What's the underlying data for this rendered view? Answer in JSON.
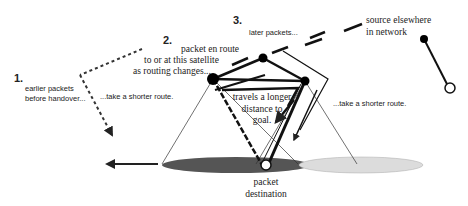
{
  "steps": [
    {
      "number": "1.",
      "label_lines": [
        "earlier packets",
        "before handover..."
      ],
      "route_note": "...take a shorter route."
    },
    {
      "number": "2.",
      "label_lines": [
        "packet en route",
        "to or at this satellite",
        "as routing changes..."
      ],
      "route_note": "travels a longer distance to goal."
    },
    {
      "number": "3.",
      "label_lines": [
        "later packets..."
      ],
      "route_note": "...take a shorter route."
    }
  ],
  "labels": {
    "step1_number": "1.",
    "step1_line1": "earlier packets",
    "step1_line2": "before handover...",
    "step1_route": "...take a shorter route.",
    "step2_number": "2.",
    "step2_line1": "packet en route",
    "step2_line2": "to or at this satellite",
    "step2_line3": "as routing changes...",
    "step2_route_line1": "travels a longer",
    "step2_route_line2": "distance to",
    "step2_route_line3": "goal.",
    "step3_number": "3.",
    "step3_line1": "later packets...",
    "step3_route": "...take a shorter route.",
    "source_line1": "source elsewhere",
    "source_line2": "in network",
    "destination_line1": "packet",
    "destination_line2": "destination"
  },
  "nodes": [
    {
      "id": "satellite-left",
      "type": "satellite",
      "fill": "#000000"
    },
    {
      "id": "satellite-top",
      "type": "satellite",
      "fill": "#000000"
    },
    {
      "id": "satellite-right",
      "type": "satellite",
      "fill": "#000000"
    },
    {
      "id": "source",
      "type": "satellite",
      "fill": "#000000"
    },
    {
      "id": "source-ground",
      "type": "ground",
      "fill": "#ffffff"
    },
    {
      "id": "destination",
      "type": "ground",
      "fill": "#ffffff"
    }
  ],
  "footprints": [
    {
      "id": "footprint-left",
      "fill": "#555555"
    },
    {
      "id": "footprint-right",
      "fill": "#dddddd"
    }
  ],
  "colors": {
    "ink": "#111111",
    "footprint_dark": "#555555",
    "footprint_light": "#dcdcdc"
  }
}
